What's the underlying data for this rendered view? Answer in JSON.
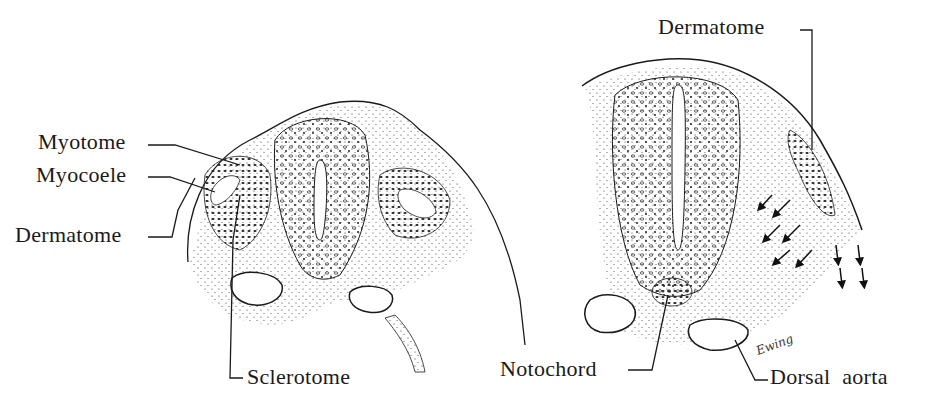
{
  "figure": {
    "left_section": {
      "description": "Transverse section of embryo: early somite stage",
      "labels": {
        "myotome": "Myotome",
        "myocoele": "Myocoele",
        "dermatome": "Dermatome",
        "sclerotome": "Sclerotome"
      }
    },
    "right_section": {
      "description": "Transverse section of embryo: later stage, sclerotome cells migrating",
      "labels": {
        "dermatome": "Dermatome",
        "notochord": "Notochord",
        "dorsal_aorta": "Dorsal aorta"
      },
      "signature": "Ewing"
    },
    "colors": {
      "ink": "#1a1a1a",
      "background": "#ffffff"
    }
  }
}
